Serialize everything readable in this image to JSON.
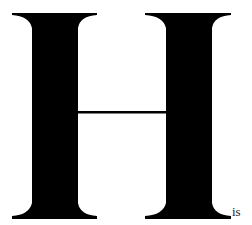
{
  "drop_cap": {
    "letter": "H",
    "color": "#000000"
  },
  "following_text": "is"
}
